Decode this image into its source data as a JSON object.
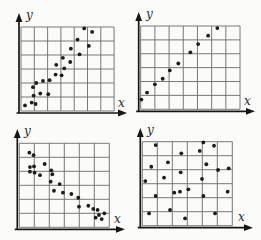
{
  "page": {
    "background": "#fbfbf9"
  },
  "colors": {
    "grid": "#6a6a6a",
    "axis": "#161616",
    "dot": "#1c1c1c",
    "label": "#2a2a2a"
  },
  "chart_data": [
    {
      "type": "scatter",
      "position": "top-left",
      "title": "",
      "xlabel": "x",
      "ylabel": "y",
      "xlim": [
        0,
        7
      ],
      "ylim": [
        0,
        6
      ],
      "grid": true,
      "pattern": "positive-correlation-scattered",
      "points": [
        [
          0.3,
          0.4
        ],
        [
          0.8,
          0.6
        ],
        [
          1.1,
          0.5
        ],
        [
          0.95,
          1.1
        ],
        [
          1.45,
          1.25
        ],
        [
          2.05,
          1.2
        ],
        [
          0.9,
          1.7
        ],
        [
          1.15,
          2.0
        ],
        [
          1.65,
          2.15
        ],
        [
          2.15,
          2.2
        ],
        [
          2.6,
          2.6
        ],
        [
          3.05,
          2.55
        ],
        [
          2.65,
          3.3
        ],
        [
          3.25,
          3.05
        ],
        [
          3.15,
          3.8
        ],
        [
          3.7,
          3.5
        ],
        [
          3.75,
          4.45
        ],
        [
          4.4,
          4.05
        ],
        [
          4.25,
          5.1
        ],
        [
          5.1,
          4.65
        ],
        [
          4.75,
          5.9
        ],
        [
          5.35,
          5.65
        ]
      ]
    },
    {
      "type": "scatter",
      "position": "top-right",
      "title": "",
      "xlabel": "x",
      "ylabel": "y",
      "xlim": [
        0,
        7
      ],
      "ylim": [
        0,
        6
      ],
      "grid": true,
      "pattern": "strong-positive-linear",
      "points": [
        [
          0.05,
          0.7
        ],
        [
          0.45,
          1.2
        ],
        [
          1.0,
          1.8
        ],
        [
          1.55,
          2.2
        ],
        [
          2.05,
          2.8
        ],
        [
          2.65,
          3.3
        ],
        [
          3.5,
          4.1
        ],
        [
          4.05,
          4.7
        ],
        [
          4.75,
          5.3
        ],
        [
          5.4,
          5.85
        ]
      ]
    },
    {
      "type": "scatter",
      "position": "bottom-left",
      "title": "",
      "xlabel": "x",
      "ylabel": "y",
      "xlim": [
        0,
        6
      ],
      "ylim": [
        0,
        6
      ],
      "grid": true,
      "pattern": "negative-correlation-scattered",
      "points": [
        [
          0.67,
          5.33
        ],
        [
          0.95,
          5.15
        ],
        [
          0.71,
          4.3
        ],
        [
          0.98,
          4.35
        ],
        [
          0.71,
          3.97
        ],
        [
          1.02,
          3.9
        ],
        [
          1.38,
          3.72
        ],
        [
          1.69,
          4.52
        ],
        [
          2.13,
          4.07
        ],
        [
          2.2,
          3.79
        ],
        [
          2.09,
          3.26
        ],
        [
          2.69,
          3.09
        ],
        [
          2.31,
          2.61
        ],
        [
          2.91,
          2.47
        ],
        [
          3.47,
          2.38
        ],
        [
          3.93,
          2.11
        ],
        [
          3.98,
          1.47
        ],
        [
          4.6,
          1.54
        ],
        [
          4.93,
          1.31
        ],
        [
          5.22,
          1.24
        ],
        [
          5.67,
          1.0
        ],
        [
          5.31,
          0.88
        ],
        [
          5.09,
          0.69
        ],
        [
          5.49,
          0.59
        ]
      ]
    },
    {
      "type": "scatter",
      "position": "bottom-right",
      "title": "",
      "xlabel": "x",
      "ylabel": "y",
      "xlim": [
        0,
        6
      ],
      "ylim": [
        0,
        6
      ],
      "grid": true,
      "pattern": "no-correlation-random",
      "points": [
        [
          0.89,
          5.76
        ],
        [
          4.07,
          5.95
        ],
        [
          4.78,
          5.71
        ],
        [
          2.6,
          5.17
        ],
        [
          3.83,
          5.34
        ],
        [
          0.6,
          4.21
        ],
        [
          1.71,
          4.53
        ],
        [
          4.27,
          4.39
        ],
        [
          5.05,
          3.98
        ],
        [
          5.76,
          4.1
        ],
        [
          2.56,
          3.81
        ],
        [
          0.2,
          3.19
        ],
        [
          1.45,
          3.43
        ],
        [
          3.98,
          3.34
        ],
        [
          0.89,
          2.12
        ],
        [
          2.13,
          2.36
        ],
        [
          2.51,
          2.43
        ],
        [
          3.07,
          2.6
        ],
        [
          4.07,
          2.12
        ],
        [
          5.69,
          2.43
        ],
        [
          0.45,
          0.88
        ],
        [
          1.85,
          1.12
        ],
        [
          2.85,
          0.52
        ],
        [
          4.85,
          0.88
        ]
      ]
    }
  ]
}
